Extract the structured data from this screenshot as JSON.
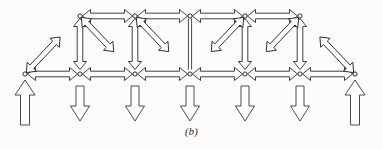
{
  "figure": {
    "caption": "(b)",
    "type": "truss-force-diagram",
    "ink_color": "#1b1b1b",
    "paper_color": "#fdfcfa"
  },
  "geometry": {
    "span_px": 330,
    "bottom_chord_y": 74,
    "top_chord_y": 16,
    "panel_width": 55,
    "bottom_nodes_x": [
      25,
      80,
      135,
      190,
      245,
      300,
      355
    ],
    "top_nodes_x": [
      80,
      135,
      190,
      245,
      300
    ]
  },
  "joints": [
    {
      "name": "L0",
      "x": 25,
      "y": 74,
      "chord": "bottom"
    },
    {
      "name": "L1",
      "x": 80,
      "y": 74,
      "chord": "bottom"
    },
    {
      "name": "L2",
      "x": 135,
      "y": 74,
      "chord": "bottom"
    },
    {
      "name": "L3",
      "x": 190,
      "y": 74,
      "chord": "bottom"
    },
    {
      "name": "L4",
      "x": 245,
      "y": 74,
      "chord": "bottom"
    },
    {
      "name": "L5",
      "x": 300,
      "y": 74,
      "chord": "bottom"
    },
    {
      "name": "L6",
      "x": 355,
      "y": 74,
      "chord": "bottom"
    },
    {
      "name": "U1",
      "x": 80,
      "y": 16,
      "chord": "top"
    },
    {
      "name": "U2",
      "x": 135,
      "y": 16,
      "chord": "top"
    },
    {
      "name": "U3",
      "x": 190,
      "y": 16,
      "chord": "top"
    },
    {
      "name": "U4",
      "x": 245,
      "y": 16,
      "chord": "top"
    },
    {
      "name": "U5",
      "x": 300,
      "y": 16,
      "chord": "top"
    }
  ],
  "members": [
    {
      "id": "top-U1-U2",
      "from": "U1",
      "to": "U2",
      "force": "compression",
      "arrows": "outward",
      "style": "block"
    },
    {
      "id": "top-U2-U3",
      "from": "U2",
      "to": "U3",
      "force": "compression",
      "arrows": "outward",
      "style": "block"
    },
    {
      "id": "top-U3-U4",
      "from": "U3",
      "to": "U4",
      "force": "compression",
      "arrows": "outward",
      "style": "block"
    },
    {
      "id": "top-U4-U5",
      "from": "U4",
      "to": "U5",
      "force": "compression",
      "arrows": "outward",
      "style": "block"
    },
    {
      "id": "bottom-L0-L1",
      "from": "L0",
      "to": "L1",
      "force": "tension",
      "arrows": "inward",
      "style": "block"
    },
    {
      "id": "bottom-L1-L2",
      "from": "L1",
      "to": "L2",
      "force": "tension",
      "arrows": "inward",
      "style": "block"
    },
    {
      "id": "bottom-L2-L3",
      "from": "L2",
      "to": "L3",
      "force": "tension",
      "arrows": "inward",
      "style": "block"
    },
    {
      "id": "bottom-L3-L4",
      "from": "L3",
      "to": "L4",
      "force": "tension",
      "arrows": "inward",
      "style": "block"
    },
    {
      "id": "bottom-L4-L5",
      "from": "L4",
      "to": "L5",
      "force": "tension",
      "arrows": "inward",
      "style": "block"
    },
    {
      "id": "bottom-L5-L6",
      "from": "L5",
      "to": "L6",
      "force": "tension",
      "arrows": "inward",
      "style": "block"
    },
    {
      "id": "end-diag-L0-U1",
      "from": "L0",
      "to": "U1",
      "force": "compression",
      "arrows": "outward",
      "style": "block"
    },
    {
      "id": "end-diag-L6-U5",
      "from": "L6",
      "to": "U5",
      "force": "compression",
      "arrows": "outward",
      "style": "block"
    },
    {
      "id": "vert-U1-L1",
      "from": "U1",
      "to": "L1",
      "force": "compression",
      "arrows": "outward",
      "style": "block"
    },
    {
      "id": "vert-U2-L2",
      "from": "U2",
      "to": "L2",
      "force": "compression",
      "arrows": "outward",
      "style": "block"
    },
    {
      "id": "vert-U3-L3",
      "from": "U3",
      "to": "L3",
      "force": "zero",
      "arrows": "none",
      "style": "thin"
    },
    {
      "id": "vert-U4-L4",
      "from": "U4",
      "to": "L4",
      "force": "compression",
      "arrows": "outward",
      "style": "block"
    },
    {
      "id": "vert-U5-L5",
      "from": "U5",
      "to": "L5",
      "force": "compression",
      "arrows": "outward",
      "style": "block"
    },
    {
      "id": "diag-U1-L2",
      "from": "U1",
      "to": "L2",
      "force": "tension",
      "arrows": "inward",
      "style": "block"
    },
    {
      "id": "diag-U2-L3",
      "from": "U2",
      "to": "L3",
      "force": "tension",
      "arrows": "inward",
      "style": "block"
    },
    {
      "id": "diag-U4-L3",
      "from": "U4",
      "to": "L3",
      "force": "tension",
      "arrows": "inward",
      "style": "block"
    },
    {
      "id": "diag-U5-L4",
      "from": "U5",
      "to": "L4",
      "force": "tension",
      "arrows": "inward",
      "style": "block"
    }
  ],
  "applied_loads": [
    {
      "name": "load-L1",
      "at_joint": "L1",
      "x": 80,
      "direction": "down",
      "magnitude_px": 38
    },
    {
      "name": "load-L2",
      "at_joint": "L2",
      "x": 135,
      "direction": "down",
      "magnitude_px": 38
    },
    {
      "name": "load-L3",
      "at_joint": "L3",
      "x": 190,
      "direction": "down",
      "magnitude_px": 38
    },
    {
      "name": "load-L4",
      "at_joint": "L4",
      "x": 245,
      "direction": "down",
      "magnitude_px": 38
    },
    {
      "name": "load-L5",
      "at_joint": "L5",
      "x": 300,
      "direction": "down",
      "magnitude_px": 38
    },
    {
      "name": "load-L2b",
      "at_joint": "L2",
      "x": 135,
      "direction": "down",
      "magnitude_px": 38
    }
  ],
  "reactions": [
    {
      "name": "reaction-left",
      "at_joint": "L0",
      "x": 25,
      "direction": "up",
      "magnitude_px": 48
    },
    {
      "name": "reaction-right",
      "at_joint": "L6",
      "x": 355,
      "direction": "up",
      "magnitude_px": 48
    }
  ]
}
